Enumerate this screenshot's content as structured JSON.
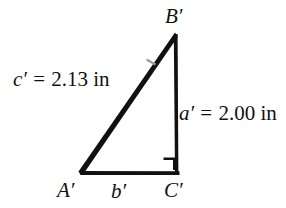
{
  "figure": {
    "type": "right-triangle-diagram",
    "background_color": "#ffffff",
    "stroke_color": "#111111",
    "vertices": [
      {
        "name": "A-prime",
        "label": "A′",
        "x": 78,
        "y": 173
      },
      {
        "name": "B-prime",
        "label": "B′",
        "x": 175,
        "y": 34
      },
      {
        "name": "C-prime",
        "label": "C′",
        "x": 177,
        "y": 173
      }
    ],
    "right_angle": {
      "at": "C′",
      "marker": "square"
    },
    "vertex_labels": {
      "top": "B′",
      "bottom_left": "A′",
      "bottom_right": "C′"
    },
    "side_labels": {
      "hypotenuse": {
        "variable": "c′",
        "equals": "=",
        "value": "2.13",
        "unit": "in",
        "full": "c′ = 2.13 in"
      },
      "vertical_leg": {
        "variable": "a′",
        "equals": "=",
        "value": "2.00",
        "unit": "in",
        "full": "a′ = 2.00 in"
      },
      "base_leg": {
        "variable": "b′",
        "equals": "",
        "value": "",
        "unit": "",
        "full": "b′"
      }
    },
    "tick_marks": [
      {
        "on": "hypotenuse",
        "count": 1,
        "color": "#8a8a8a"
      }
    ]
  }
}
